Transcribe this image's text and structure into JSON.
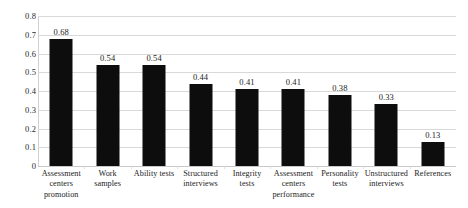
{
  "chart_data": {
    "type": "bar",
    "title": "",
    "subtitle": "",
    "xlabel": "",
    "ylabel": "",
    "ylim": [
      0,
      0.8
    ],
    "ytick_values": [
      0,
      0.1,
      0.2,
      0.3,
      0.4,
      0.5,
      0.6,
      0.7,
      0.8
    ],
    "ytick_labels": [
      "0",
      "0.1",
      "0.2",
      "0.3",
      "0.4",
      "0.5",
      "0.6",
      "0.7",
      "0.8"
    ],
    "grid": "horizontal",
    "legend": "none",
    "bar_color": "#0d0d0d",
    "gridline_color": "#d9d9d9",
    "background_color": "#ffffff",
    "data_labels_shown": true,
    "categories": [
      "Assessment centers promotion",
      "Work samples",
      "Ability tests",
      "Structured interviews",
      "Integrity tests",
      "Assessment centers performance",
      "Personality tests",
      "Unstructured interviews",
      "References"
    ],
    "category_label_lines": [
      [
        "Assessment",
        "centers",
        "promotion"
      ],
      [
        "Work",
        "samples"
      ],
      [
        "Ability tests"
      ],
      [
        "Structured",
        "interviews"
      ],
      [
        "Integrity",
        "tests"
      ],
      [
        "Assessment",
        "centers",
        "performance"
      ],
      [
        "Personality",
        "tests"
      ],
      [
        "Unstructured",
        "interviews"
      ],
      [
        "References"
      ]
    ],
    "values": [
      0.68,
      0.54,
      0.54,
      0.44,
      0.41,
      0.41,
      0.38,
      0.33,
      0.13
    ],
    "value_labels": [
      "0.68",
      "0.54",
      "0.54",
      "0.44",
      "0.41",
      "0.41",
      "0.38",
      "0.33",
      "0.13"
    ]
  }
}
